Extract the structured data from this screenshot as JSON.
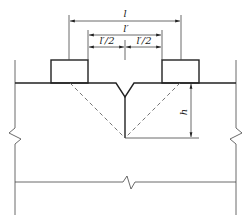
{
  "diagram": {
    "type": "cross-section",
    "dimensions": {
      "outer_span": "l",
      "inner_span": "l'",
      "half_left": "l'/2",
      "half_right": "l'/2",
      "depth": "h"
    },
    "elements": [
      "left-block",
      "right-block",
      "v-notch",
      "crack-line",
      "dashed-failure-lines",
      "slab-body",
      "break-symbols"
    ],
    "colors": {
      "line": "#222222",
      "background": "#ffffff"
    }
  }
}
